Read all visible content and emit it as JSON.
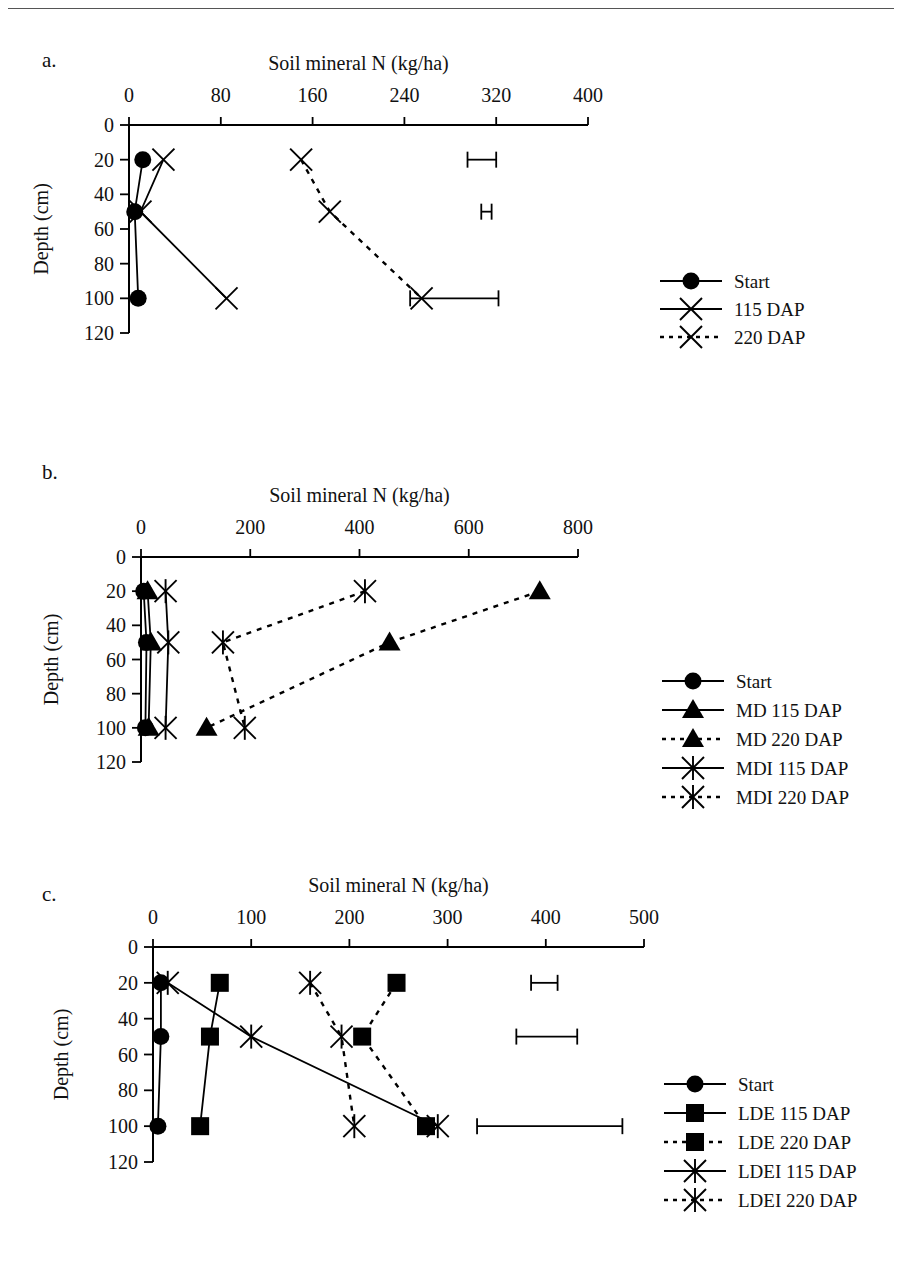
{
  "figure": {
    "top_rule": true,
    "axis_title_x": "Soil mineral N (kg/ha)",
    "axis_title_y": "Depth (cm)",
    "depth_ticks": [
      0,
      20,
      40,
      60,
      80,
      100,
      120
    ]
  },
  "panels": [
    {
      "label": "a.",
      "xlabel": "Soil mineral N (kg/ha)",
      "ylabel": "Depth (cm)",
      "xticks": [
        0,
        80,
        160,
        240,
        320,
        400
      ],
      "yticks": [
        0,
        20,
        40,
        60,
        80,
        100,
        120
      ],
      "legend": [
        {
          "label": "Start",
          "marker": "circle",
          "line": "solid"
        },
        {
          "label": "115 DAP",
          "marker": "x",
          "line": "solid"
        },
        {
          "label": "220 DAP",
          "marker": "x",
          "line": "dotted"
        }
      ]
    },
    {
      "label": "b.",
      "xlabel": "Soil mineral N (kg/ha)",
      "ylabel": "Depth (cm)",
      "xticks": [
        0,
        200,
        400,
        600,
        800
      ],
      "yticks": [
        0,
        20,
        40,
        60,
        80,
        100,
        120
      ],
      "legend": [
        {
          "label": "Start",
          "marker": "circle",
          "line": "solid"
        },
        {
          "label": "MD 115 DAP",
          "marker": "triangle",
          "line": "solid"
        },
        {
          "label": "MD 220 DAP",
          "marker": "triangle",
          "line": "dotted"
        },
        {
          "label": "MDI 115 DAP",
          "marker": "star",
          "line": "solid"
        },
        {
          "label": "MDI 220 DAP",
          "marker": "star",
          "line": "dotted"
        }
      ]
    },
    {
      "label": "c.",
      "xlabel": "Soil mineral N (kg/ha)",
      "ylabel": "Depth (cm)",
      "xticks": [
        0,
        100,
        200,
        300,
        400,
        500
      ],
      "yticks": [
        0,
        20,
        40,
        60,
        80,
        100,
        120
      ],
      "legend": [
        {
          "label": "Start",
          "marker": "circle",
          "line": "solid"
        },
        {
          "label": "LDE 115 DAP",
          "marker": "square",
          "line": "solid"
        },
        {
          "label": "LDE 220 DAP",
          "marker": "square",
          "line": "dotted"
        },
        {
          "label": "LDEI 115 DAP",
          "marker": "star",
          "line": "solid"
        },
        {
          "label": "LDEI 220 DAP",
          "marker": "star",
          "line": "dotted"
        }
      ]
    }
  ],
  "chart_data": [
    {
      "type": "line",
      "panel": "a",
      "title": "",
      "xlabel": "Soil mineral N (kg/ha)",
      "ylabel": "Depth (cm)",
      "xlim": [
        0,
        400
      ],
      "ylim": [
        0,
        120
      ],
      "y_inverted": true,
      "grid": false,
      "legend_position": "right",
      "depths": [
        20,
        50,
        100
      ],
      "series": [
        {
          "name": "Start",
          "marker": "circle",
          "line": "solid",
          "values": [
            12,
            5,
            8
          ]
        },
        {
          "name": "115 DAP",
          "marker": "x",
          "line": "solid",
          "values": [
            30,
            10,
            85
          ]
        },
        {
          "name": "220 DAP",
          "marker": "x",
          "line": "dotted",
          "values": [
            150,
            175,
            255
          ]
        }
      ],
      "error_bars": [
        {
          "depth": 20,
          "low": 295,
          "high": 320
        },
        {
          "depth": 50,
          "low": 307,
          "high": 316
        },
        {
          "depth": 100,
          "low": 245,
          "high": 322
        }
      ]
    },
    {
      "type": "line",
      "panel": "b",
      "title": "",
      "xlabel": "Soil mineral N (kg/ha)",
      "ylabel": "Depth (cm)",
      "xlim": [
        0,
        800
      ],
      "ylim": [
        0,
        120
      ],
      "y_inverted": true,
      "grid": false,
      "legend_position": "right",
      "depths": [
        20,
        50,
        100
      ],
      "series": [
        {
          "name": "Start",
          "marker": "circle",
          "line": "solid",
          "values": [
            5,
            10,
            8
          ]
        },
        {
          "name": "MD 115 DAP",
          "marker": "triangle",
          "line": "solid",
          "values": [
            12,
            18,
            14
          ]
        },
        {
          "name": "MD 220 DAP",
          "marker": "triangle",
          "line": "dotted",
          "values": [
            730,
            455,
            120
          ]
        },
        {
          "name": "MDI 115 DAP",
          "marker": "star",
          "line": "solid",
          "values": [
            45,
            50,
            45
          ]
        },
        {
          "name": "MDI 220 DAP",
          "marker": "star",
          "line": "dotted",
          "values": [
            410,
            150,
            190
          ]
        }
      ],
      "error_bars": []
    },
    {
      "type": "line",
      "panel": "c",
      "title": "",
      "xlabel": "Soil mineral N (kg/ha)",
      "ylabel": "Depth (cm)",
      "xlim": [
        0,
        500
      ],
      "ylim": [
        0,
        120
      ],
      "y_inverted": true,
      "grid": false,
      "legend_position": "right",
      "depths": [
        20,
        50,
        100
      ],
      "series": [
        {
          "name": "Start",
          "marker": "circle",
          "line": "solid",
          "values": [
            8,
            8,
            5
          ]
        },
        {
          "name": "LDE 115 DAP",
          "marker": "square",
          "line": "solid",
          "values": [
            68,
            58,
            48
          ]
        },
        {
          "name": "LDE 220 DAP",
          "marker": "square",
          "line": "dotted",
          "values": [
            248,
            213,
            278
          ]
        },
        {
          "name": "LDEI 115 DAP",
          "marker": "star",
          "line": "solid",
          "values": [
            15,
            100,
            290
          ]
        },
        {
          "name": "LDEI 220 DAP",
          "marker": "star",
          "line": "dotted",
          "values": [
            160,
            192,
            205
          ]
        }
      ],
      "error_bars": [
        {
          "depth": 20,
          "low": 385,
          "high": 412
        },
        {
          "depth": 50,
          "low": 370,
          "high": 432
        },
        {
          "depth": 100,
          "low": 330,
          "high": 478
        }
      ]
    }
  ]
}
